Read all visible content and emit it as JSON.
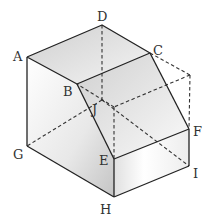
{
  "diagram": {
    "type": "3d-solid-cut-cube",
    "colors": {
      "edge": "#222222",
      "hidden_edge": "#333333",
      "shade_dark": "#c8c8c8",
      "shade_light": "#f7f7f7",
      "label": "#333333"
    },
    "labels": {
      "A": "A",
      "B": "B",
      "C": "C",
      "D": "D",
      "E": "E",
      "F": "F",
      "G": "G",
      "H": "H",
      "I": "I",
      "J": "J"
    },
    "vertices": {
      "A": [
        27,
        57
      ],
      "B": [
        77,
        84
      ],
      "C": [
        150,
        53
      ],
      "D": [
        102,
        25
      ],
      "E": [
        114,
        159
      ],
      "F": [
        189,
        129
      ],
      "G": [
        27,
        146
      ],
      "H": [
        114,
        197
      ],
      "I": [
        189,
        166
      ],
      "J": [
        102,
        100
      ],
      "K": [
        190,
        75
      ],
      "L": [
        114,
        107
      ]
    },
    "solid_edges": [
      [
        "A",
        "D"
      ],
      [
        "D",
        "C"
      ],
      [
        "A",
        "B"
      ],
      [
        "B",
        "C"
      ],
      [
        "A",
        "G"
      ],
      [
        "G",
        "H"
      ],
      [
        "H",
        "E"
      ],
      [
        "H",
        "I"
      ],
      [
        "I",
        "F"
      ],
      [
        "E",
        "F"
      ],
      [
        "B",
        "E"
      ],
      [
        "C",
        "F"
      ]
    ],
    "hidden_edges": [
      [
        "D",
        "J"
      ],
      [
        "J",
        "G"
      ],
      [
        "J",
        "I"
      ],
      [
        "C",
        "K"
      ],
      [
        "K",
        "F"
      ],
      [
        "K",
        "L"
      ],
      [
        "L",
        "B"
      ],
      [
        "L",
        "E"
      ]
    ]
  }
}
